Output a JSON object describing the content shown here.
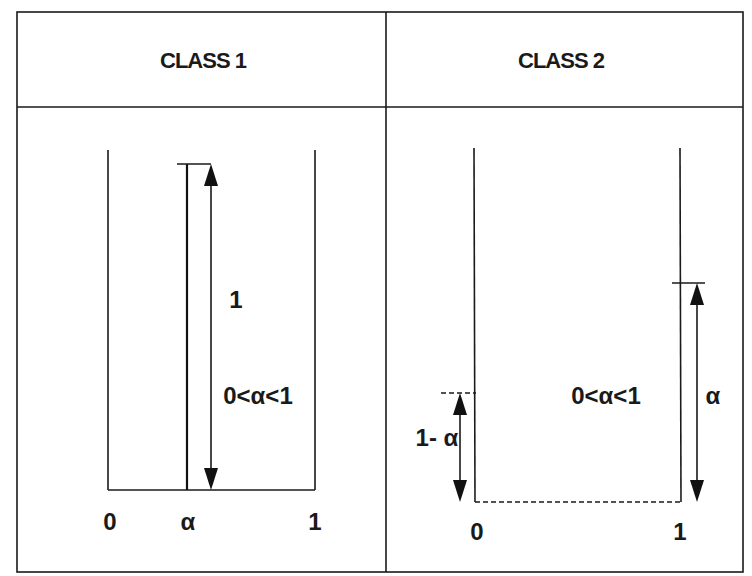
{
  "panels": [
    {
      "header": "CLASS 1",
      "axis_labels": {
        "left": "0",
        "middle": "α",
        "right": "1"
      },
      "height_label": "1",
      "condition_label": "0<α<1"
    },
    {
      "header": "CLASS 2",
      "axis_labels": {
        "left": "0",
        "right": "1"
      },
      "left_height_label": "1- α",
      "right_height_label": "α",
      "condition_label": "0<α<1"
    }
  ],
  "colors": {
    "line": "#1a1a1a",
    "background": "#ffffff"
  }
}
